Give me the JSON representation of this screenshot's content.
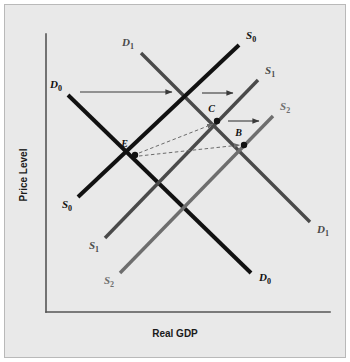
{
  "figure": {
    "background_color": "#e9e9e9",
    "border_color": "#b9b9b9",
    "axis_color": "#555555",
    "x_axis_title": "Real GDP",
    "y_axis_title": "Price Level"
  },
  "chart_data": {
    "type": "line",
    "title": "",
    "subtitle": "",
    "xlabel": "Real GDP",
    "ylabel": "Price Level",
    "grid": false,
    "legend_position": "inline-end-labels",
    "axis_origin": {
      "x": 46,
      "y": 312
    },
    "axis_x_end": {
      "x": 330,
      "y": 312
    },
    "axis_y_end": {
      "x": 46,
      "y": 34
    },
    "series": [
      {
        "name": "D0",
        "label": "D",
        "subscript": "0",
        "role": "aggregate-demand",
        "slope": "downward",
        "color": "#111111",
        "width": 4,
        "x1": 68,
        "y1": 95,
        "x2": 251,
        "y2": 273,
        "label_start": {
          "x": 62,
          "y": 88,
          "anchor": "end"
        },
        "label_end": {
          "x": 259,
          "y": 281,
          "anchor": "start"
        }
      },
      {
        "name": "D1",
        "label": "D",
        "subscript": "1",
        "role": "aggregate-demand-shifted",
        "slope": "downward",
        "color": "#4a4a4a",
        "width": 3.4,
        "x1": 141,
        "y1": 53,
        "x2": 310,
        "y2": 222,
        "label_start": {
          "x": 134,
          "y": 46,
          "anchor": "end"
        },
        "label_end": {
          "x": 317,
          "y": 233,
          "anchor": "start"
        }
      },
      {
        "name": "S0",
        "label": "S",
        "subscript": "0",
        "role": "aggregate-supply",
        "slope": "upward",
        "color": "#111111",
        "width": 4,
        "x1": 78,
        "y1": 197,
        "x2": 239,
        "y2": 45,
        "label_start": {
          "x": 72,
          "y": 208,
          "anchor": "end"
        },
        "label_end": {
          "x": 246,
          "y": 39,
          "anchor": "start"
        }
      },
      {
        "name": "S1",
        "label": "S",
        "subscript": "1",
        "role": "aggregate-supply-shifted-1",
        "slope": "upward",
        "color": "#4a4a4a",
        "width": 3.4,
        "x1": 105,
        "y1": 238,
        "x2": 258,
        "y2": 80,
        "label_start": {
          "x": 99,
          "y": 249,
          "anchor": "end"
        },
        "label_end": {
          "x": 265,
          "y": 74,
          "anchor": "start"
        }
      },
      {
        "name": "S2",
        "label": "S",
        "subscript": "2",
        "role": "aggregate-supply-shifted-2",
        "slope": "upward",
        "color": "#6e6e6e",
        "width": 3.4,
        "x1": 120,
        "y1": 273,
        "x2": 273,
        "y2": 116,
        "label_start": {
          "x": 114,
          "y": 284,
          "anchor": "end"
        },
        "label_end": {
          "x": 280,
          "y": 110,
          "anchor": "start"
        }
      }
    ],
    "points": [
      {
        "name": "E",
        "label": "E",
        "x": 135,
        "y": 155,
        "label_x": 128,
        "label_y": 147,
        "color": "#111111",
        "r": 3.2
      },
      {
        "name": "C",
        "label": "C",
        "x": 217,
        "y": 121,
        "label_x": 215,
        "label_y": 112,
        "color": "#111111",
        "r": 3.2
      },
      {
        "name": "B",
        "label": "B",
        "x": 244,
        "y": 145,
        "label_x": 242,
        "label_y": 136,
        "color": "#111111",
        "r": 3.2
      }
    ],
    "shift_arrows": [
      {
        "name": "demand-shift-arrow",
        "style": "solid",
        "x1": 80,
        "y1": 92,
        "x2": 172,
        "y2": 92,
        "color": "#3a3a3a"
      },
      {
        "name": "supply-shift-arrow-1",
        "style": "solid",
        "x1": 202,
        "y1": 93,
        "x2": 233,
        "y2": 93,
        "color": "#3a3a3a"
      },
      {
        "name": "supply-shift-arrow-2",
        "style": "solid",
        "x1": 228,
        "y1": 121,
        "x2": 259,
        "y2": 121,
        "color": "#3a3a3a"
      }
    ],
    "equilibrium_arrows": [
      {
        "name": "equilibrium-arrow-e-to-c",
        "style": "dashed",
        "x1": 139,
        "y1": 153,
        "x2": 213,
        "y2": 124,
        "color": "#6b6b6b"
      },
      {
        "name": "equilibrium-arrow-e-to-b",
        "style": "dashed",
        "x1": 139,
        "y1": 156,
        "x2": 240,
        "y2": 145,
        "color": "#6b6b6b"
      }
    ]
  }
}
